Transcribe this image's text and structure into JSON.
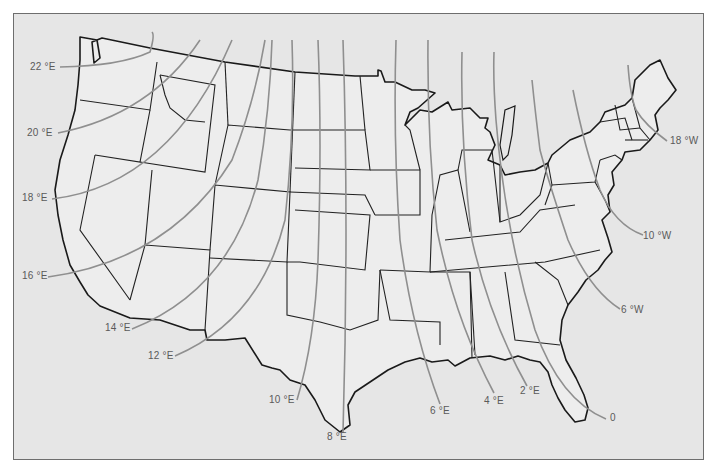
{
  "map": {
    "title": "",
    "subject": "Isogonic lines (magnetic declination) over the contiguous United States",
    "colors": {
      "background": "#e6e6e6",
      "land": "#ededed",
      "state_border": "#222222",
      "isogonic_line": "#8f8f8f",
      "label": "#5a5a5a",
      "frame": "#6e6e6e"
    },
    "isogonic_lines": [
      {
        "label": "22 °E",
        "value": 22,
        "direction": "E"
      },
      {
        "label": "20 °E",
        "value": 20,
        "direction": "E"
      },
      {
        "label": "18 °E",
        "value": 18,
        "direction": "E"
      },
      {
        "label": "16 °E",
        "value": 16,
        "direction": "E"
      },
      {
        "label": "14 °E",
        "value": 14,
        "direction": "E"
      },
      {
        "label": "12 °E",
        "value": 12,
        "direction": "E"
      },
      {
        "label": "10 °E",
        "value": 10,
        "direction": "E"
      },
      {
        "label": "8 °E",
        "value": 8,
        "direction": "E"
      },
      {
        "label": "6 °E",
        "value": 6,
        "direction": "E"
      },
      {
        "label": "4 °E",
        "value": 4,
        "direction": "E"
      },
      {
        "label": "2 °E",
        "value": 2,
        "direction": "E"
      },
      {
        "label": "0",
        "value": 0,
        "direction": ""
      },
      {
        "label": "6 °W",
        "value": 6,
        "direction": "W"
      },
      {
        "label": "10 °W",
        "value": 10,
        "direction": "W"
      },
      {
        "label": "18 °W",
        "value": 18,
        "direction": "W"
      }
    ]
  }
}
